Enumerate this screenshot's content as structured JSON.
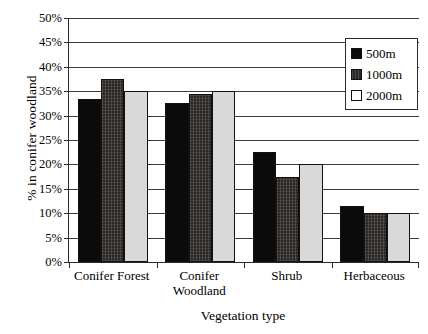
{
  "chart_data": {
    "type": "bar",
    "title": "",
    "xlabel": "Vegetation type",
    "ylabel": "% in conifer woodland",
    "categories": [
      "Conifer Forest",
      "Conifer\nWoodland",
      "Shrub",
      "Herbaceous"
    ],
    "series": [
      {
        "name": "500m",
        "values": [
          33.5,
          32.5,
          22.5,
          11.5
        ],
        "color": "#0b0b0b"
      },
      {
        "name": "1000m",
        "values": [
          37.5,
          34.5,
          17.5,
          10.0
        ],
        "color": "#2a2724"
      },
      {
        "name": "2000m",
        "values": [
          35.0,
          35.0,
          20.0,
          10.0
        ],
        "color": "#d9d9d9"
      }
    ],
    "ylim": [
      0,
      50
    ],
    "ytick_step": 5,
    "ytick_labels": [
      "50%",
      "45%",
      "40%",
      "35%",
      "30%",
      "25%",
      "20%",
      "15%",
      "10%",
      "5%",
      "0%"
    ],
    "ytick_values": [
      50,
      45,
      40,
      35,
      30,
      25,
      20,
      15,
      10,
      5,
      0
    ],
    "grid": true,
    "grid_axis": "y",
    "legend_position": "top-right",
    "legend_entries": [
      "500m",
      "1000m",
      "2000m"
    ],
    "bar_style": "grouped"
  },
  "axis": {
    "y_title": "% in conifer woodland",
    "x_title": "Vegetation type"
  },
  "legend": {
    "items": [
      {
        "label": "500m"
      },
      {
        "label": "1000m"
      },
      {
        "label": "2000m"
      }
    ]
  }
}
